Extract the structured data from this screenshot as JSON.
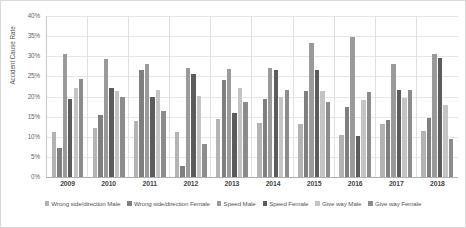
{
  "chart_data": {
    "type": "bar",
    "title": "",
    "xlabel": "",
    "ylabel": "Accident Cause Rate",
    "ylim": [
      0,
      40
    ],
    "ytick_labels": [
      "40%",
      "35%",
      "30%",
      "25%",
      "20%",
      "15%",
      "10%",
      "5%",
      "0%"
    ],
    "ytick_values": [
      40,
      35,
      30,
      25,
      20,
      15,
      10,
      5,
      0
    ],
    "grid": true,
    "legend_position": "bottom",
    "categories": [
      "2009",
      "2010",
      "2011",
      "2012",
      "2013",
      "2014",
      "2015",
      "2016",
      "2017",
      "2018"
    ],
    "series": [
      {
        "name": "Wrong side/direction Male",
        "color": "#b3b3b3",
        "values": [
          11.3,
          12.3,
          13.8,
          11.3,
          14.3,
          13.5,
          13.1,
          10.4,
          13.1,
          11.5
        ]
      },
      {
        "name": "Wrong side/direction Female",
        "color": "#7f7f7f",
        "values": [
          7.3,
          15.5,
          26.7,
          2.7,
          24.2,
          19.3,
          21.3,
          17.5,
          14.2,
          14.6
        ]
      },
      {
        "name": "Speed Male",
        "color": "#9a9a9a",
        "values": [
          30.6,
          29.4,
          28.2,
          27.2,
          26.8,
          27.2,
          33.3,
          34.7,
          28.2,
          30.5
        ]
      },
      {
        "name": "Speed Female",
        "color": "#5c5c5c",
        "values": [
          19.5,
          22.2,
          20.0,
          25.5,
          16.0,
          26.5,
          26.7,
          10.3,
          21.6,
          29.6
        ]
      },
      {
        "name": "Give way Male",
        "color": "#c4c4c4",
        "values": [
          22.1,
          21.3,
          21.5,
          20.2,
          22.0,
          20.0,
          21.4,
          19.1,
          19.7,
          18.0
        ]
      },
      {
        "name": "Give way Female",
        "color": "#8c8c8c",
        "values": [
          24.3,
          19.9,
          16.5,
          8.3,
          18.7,
          21.7,
          18.6,
          21.0,
          21.5,
          9.5
        ]
      }
    ]
  }
}
